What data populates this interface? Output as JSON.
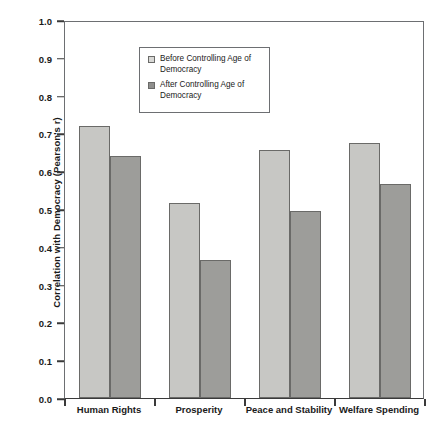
{
  "chart_data": {
    "type": "bar",
    "title": "",
    "xlabel": "",
    "ylabel": "Correlation with Democracy (Pearson's r)",
    "categories": [
      "Human Rights",
      "Prosperity",
      "Peace and Stability",
      "Welfare Spending"
    ],
    "series": [
      {
        "name": "Before Controlling Age of Democracy",
        "values": [
          0.72,
          0.515,
          0.655,
          0.675
        ],
        "color": "#c7c7c4"
      },
      {
        "name": "After Controlling Age of Democracy",
        "values": [
          0.64,
          0.365,
          0.495,
          0.565
        ],
        "color": "#9d9d9a"
      }
    ],
    "ylim": [
      0.0,
      1.0
    ],
    "ytick_labels": [
      "1.0",
      "0.9",
      "0.8",
      "0.7",
      "0.6",
      "0.5",
      "0.4",
      "0.3",
      "0.2",
      "0.1",
      "0.0"
    ],
    "ytick_values": [
      1.0,
      0.9,
      0.8,
      0.7,
      0.6,
      0.5,
      0.4,
      0.3,
      0.2,
      0.1,
      0.0
    ],
    "grid": false,
    "legend_position": "top-center"
  },
  "legend": {
    "entries": [
      {
        "label": "Before Controlling Age of Democracy",
        "swatch": "legend-swatch-before"
      },
      {
        "label": "After Controlling Age of Democracy",
        "swatch": "legend-swatch-after"
      }
    ]
  },
  "axes": {
    "y_title": "Correlation with Democracy (Pearson's r)",
    "x_labels": [
      "Human Rights",
      "Prosperity",
      "Peace and Stability",
      "Welfare Spending"
    ]
  }
}
